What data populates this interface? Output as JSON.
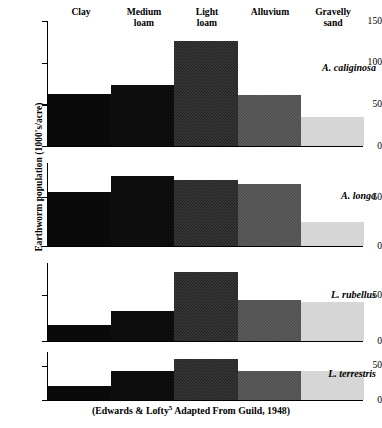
{
  "figure": {
    "ylabel": "Earthworm population (1000's/acre)",
    "caption_pre": "(Edwards & Lofty",
    "caption_sup": "5",
    "caption_post": " Adapted From Guild, 1948)"
  },
  "headers": [
    {
      "line1": "Clay",
      "line2": ""
    },
    {
      "line1": "Medium",
      "line2": "loam"
    },
    {
      "line1": "Light",
      "line2": "loam"
    },
    {
      "line1": "Alluvium",
      "line2": ""
    },
    {
      "line1": "Gravelly",
      "line2": "sand"
    }
  ],
  "colors": {
    "clay": "#0a0a0a",
    "medium_loam": "#0d0d0d",
    "light_loam": "#3a3a3a",
    "alluvium": "#5d5d5d",
    "gravelly_sand": "#d6d6d6",
    "axis": "#000000",
    "background": "#ffffff"
  },
  "chart_data": {
    "type": "bar",
    "title": "",
    "xlabel": "",
    "ylabel": "Earthworm population (1000's/acre)",
    "categories": [
      "Clay",
      "Medium loam",
      "Light loam",
      "Alluvium",
      "Gravelly sand"
    ],
    "grid": false,
    "legend": "none",
    "panels": [
      {
        "name": "A. caliginosa",
        "species_label": "A. caliginosa",
        "values": [
          63,
          73,
          126,
          61,
          35
        ],
        "ylim": [
          0,
          150
        ],
        "yticks": [
          0,
          50,
          100,
          150
        ],
        "yticklabels": [
          "0",
          "50",
          "100",
          "150"
        ]
      },
      {
        "name": "A. longa",
        "species_label": "A. longa",
        "values": [
          55,
          72,
          68,
          63,
          25
        ],
        "ylim": [
          0,
          85
        ],
        "yticks": [
          0,
          50
        ],
        "yticklabels": [
          "0",
          "50"
        ]
      },
      {
        "name": "L. rubellus",
        "species_label": "L. rubellus",
        "values": [
          17,
          33,
          75,
          45,
          43
        ],
        "ylim": [
          0,
          85
        ],
        "yticks": [
          0,
          50
        ],
        "yticklabels": [
          "0",
          "50"
        ]
      },
      {
        "name": "L. terrestris",
        "species_label": "L. terrestris",
        "values": [
          20,
          43,
          60,
          43,
          43
        ],
        "ylim": [
          0,
          70
        ],
        "yticks": [
          0,
          50
        ],
        "yticklabels": [
          "0",
          "50"
        ]
      }
    ]
  }
}
